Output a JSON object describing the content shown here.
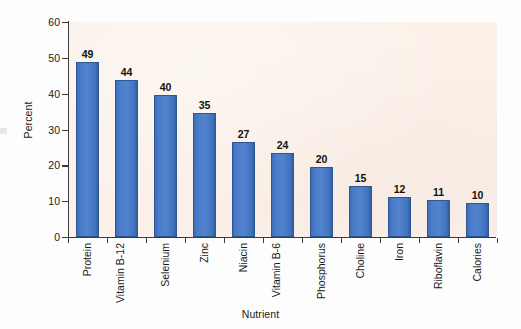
{
  "chart_data": {
    "type": "bar",
    "title": "",
    "xlabel": "Nutrient",
    "ylabel": "Percent",
    "ylim": [
      0,
      60
    ],
    "yticks": [
      0,
      10,
      20,
      30,
      40,
      50,
      60
    ],
    "grid": false,
    "legend": "none",
    "bar_color": "#4a7bc8",
    "bar_edge_color": "#2d5792",
    "plot_background": "#fbf1e9",
    "page_background": "#fdfdfd",
    "categories": [
      "Protein",
      "Vitamin B-12",
      "Selenium",
      "Zinc",
      "Niacin",
      "Vitamin B-6",
      "Phosphorus",
      "Choline",
      "Iron",
      "Riboflavin",
      "Calories"
    ],
    "category_lines": [
      [
        "Protein"
      ],
      [
        "Vitamin",
        "B-12"
      ],
      [
        "Selenium"
      ],
      [
        "Zinc"
      ],
      [
        "Niacin"
      ],
      [
        "Vitamin",
        "B-6"
      ],
      [
        "Phosphorus"
      ],
      [
        "Choline"
      ],
      [
        "Iron"
      ],
      [
        "Riboflavin"
      ],
      [
        "Calories"
      ]
    ],
    "values": [
      49,
      44,
      40,
      35,
      27,
      24,
      20,
      15,
      12,
      11,
      10
    ],
    "value_labels": [
      "49",
      "44",
      "40",
      "35",
      "27",
      "24",
      "20",
      "15",
      "12",
      "11",
      "10"
    ],
    "bar_tops_actual": [
      48.8,
      43.8,
      39.6,
      34.6,
      26.5,
      23.5,
      19.6,
      14.3,
      11.3,
      10.4,
      9.5
    ]
  }
}
